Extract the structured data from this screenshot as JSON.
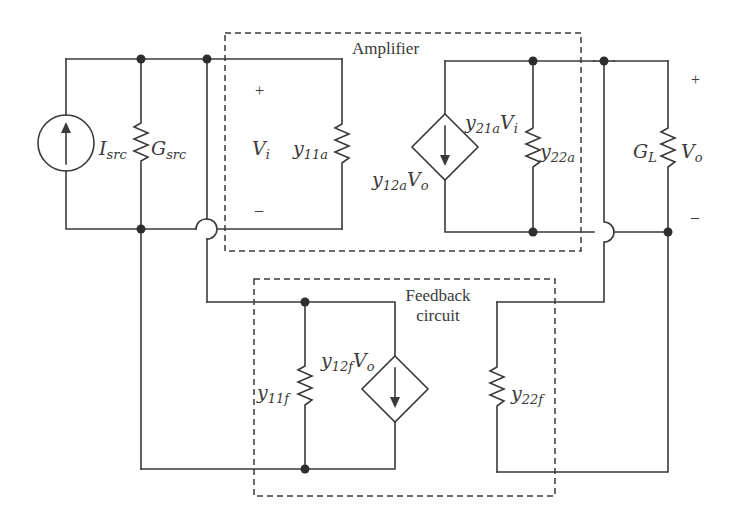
{
  "blocks": {
    "amplifier": {
      "title": "Amplifier"
    },
    "feedback": {
      "title_line1": "Feedback",
      "title_line2": "circuit"
    }
  },
  "source": {
    "current_source": {
      "symbol": "I",
      "subscript": "src"
    },
    "source_conductance": {
      "symbol": "G",
      "subscript": "src"
    }
  },
  "amplifier": {
    "input_voltage": {
      "symbol": "V",
      "subscript": "i",
      "plus": "+",
      "minus": "–"
    },
    "y11": {
      "symbol": "y",
      "subscript": "11a"
    },
    "y12_source": {
      "symbol": "y",
      "subscript": "12a",
      "factor": "V",
      "factor_subscript": "o"
    },
    "y21_source": {
      "symbol": "y",
      "subscript": "21a",
      "factor": "V",
      "factor_subscript": "i"
    },
    "y22": {
      "symbol": "y",
      "subscript": "22a"
    }
  },
  "load": {
    "load_conductance": {
      "symbol": "G",
      "subscript": "L"
    },
    "output_voltage": {
      "symbol": "V",
      "subscript": "o",
      "plus": "+",
      "minus": "–"
    }
  },
  "feedback": {
    "y11": {
      "symbol": "y",
      "subscript": "11f"
    },
    "y12_source": {
      "symbol": "y",
      "subscript": "12f",
      "factor": "V",
      "factor_subscript": "o"
    },
    "y22": {
      "symbol": "y",
      "subscript": "22f"
    }
  },
  "colors": {
    "line": "#3a3a3a",
    "background": "#ffffff"
  }
}
